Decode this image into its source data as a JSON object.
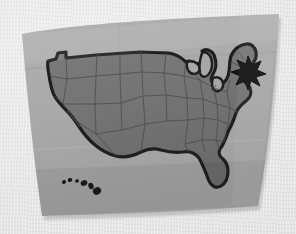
{
  "scene": {
    "kind": "photo-of-paper-map",
    "title": "Paper map of the contiguous United States",
    "background_color": "#e8e8e8",
    "width": 296,
    "height": 234,
    "color_mode": "grayscale"
  },
  "paper": {
    "name": "map-sheet",
    "description": "Slightly warped rectangular paper sheet, lighter grey than the map body",
    "fill_color": "#ababab",
    "shadow_color": "#8f8f8f",
    "corners": {
      "top_left": [
        22,
        34
      ],
      "top_right": [
        279,
        14
      ],
      "bottom_right": [
        258,
        206
      ],
      "bottom_left": [
        42,
        216
      ]
    }
  },
  "landmass": {
    "name": "contiguous-united-states",
    "fill_color": "#747474",
    "outline_color": "#1f1f1f",
    "outline_width": 3.2,
    "state_border_color": "#4a4a4a",
    "state_border_width": 0.8,
    "lakes_fill_color": "#a8a8a8"
  },
  "marker": {
    "name": "location-star",
    "shape": "star-burst",
    "fill_color": "#141414",
    "position": [
      248,
      70
    ],
    "radius": 12,
    "points": 8,
    "region": "northeast-coast"
  },
  "islands": {
    "name": "hawaii-island-chain",
    "fill_color": "#1c1c1c",
    "count": 6,
    "shapes": [
      {
        "cx": 64,
        "cy": 182,
        "rx": 2.1,
        "ry": 1.8,
        "rot": -18
      },
      {
        "cx": 70,
        "cy": 180,
        "rx": 2.3,
        "ry": 2.0,
        "rot": -18
      },
      {
        "cx": 77,
        "cy": 181,
        "rx": 2.0,
        "ry": 1.7,
        "rot": -18
      },
      {
        "cx": 84,
        "cy": 183,
        "rx": 3.4,
        "ry": 2.7,
        "rot": -22
      },
      {
        "cx": 91,
        "cy": 186,
        "rx": 2.6,
        "ry": 3.2,
        "rot": -22
      },
      {
        "cx": 97,
        "cy": 191,
        "rx": 4.2,
        "ry": 3.6,
        "rot": -28
      }
    ]
  },
  "labels": {
    "none_visible": "No printed text or legend is visible on the map"
  }
}
